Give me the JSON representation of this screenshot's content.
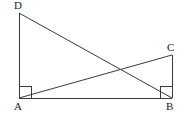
{
  "figure": {
    "background_color": "#ffffff",
    "stroke_color": "#3a3a3a",
    "stroke_width": 1,
    "canvas": {
      "width": 190,
      "height": 117
    },
    "labels": {
      "A": "A",
      "B": "B",
      "C": "C",
      "D": "D"
    },
    "points": {
      "A": {
        "x": 19,
        "y": 98
      },
      "B": {
        "x": 172,
        "y": 98
      },
      "C": {
        "x": 172,
        "y": 55
      },
      "D": {
        "x": 19,
        "y": 13
      },
      "intersection": {
        "x": 120,
        "y": 68
      }
    },
    "segments": [
      {
        "name": "AD",
        "from": "A",
        "to": "D",
        "kind": "side"
      },
      {
        "name": "AB",
        "from": "A",
        "to": "B",
        "kind": "side"
      },
      {
        "name": "BC",
        "from": "B",
        "to": "C",
        "kind": "side"
      },
      {
        "name": "DC",
        "from": "D",
        "to": "C",
        "kind": "side"
      },
      {
        "name": "DB",
        "from": "D",
        "to": "B",
        "kind": "diagonal"
      },
      {
        "name": "AC",
        "from": "A",
        "to": "C",
        "kind": "diagonal"
      }
    ],
    "right_angle_markers": [
      {
        "at": "A",
        "size": 12
      },
      {
        "at": "B",
        "size": 12
      }
    ]
  }
}
